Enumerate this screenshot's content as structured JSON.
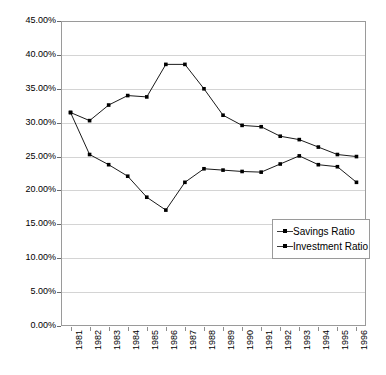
{
  "chart_data": {
    "type": "line",
    "title": "",
    "subtitle": "",
    "xlabel": "",
    "ylabel": "",
    "categories": [
      "1981",
      "1982",
      "1983",
      "1984",
      "1985",
      "1986",
      "1987",
      "1988",
      "1989",
      "1990",
      "1991",
      "1992",
      "1993",
      "1994",
      "1995",
      "1996"
    ],
    "ytick_labels": [
      "45.00%",
      "40.00%",
      "35.00%",
      "30.00%",
      "25.00%",
      "20.00%",
      "15.00%",
      "10.00%",
      "5.00%",
      "0.00%"
    ],
    "ytick_values": [
      45,
      40,
      35,
      30,
      25,
      20,
      15,
      10,
      5,
      0
    ],
    "ylim": [
      0,
      45
    ],
    "y_units": "percent",
    "grid": "horizontal",
    "legend_position": "inside-bottom-right",
    "series": [
      {
        "name": "Savings Ratio",
        "marker": "square",
        "color": "#000000",
        "values": [
          31.5,
          30.3,
          32.6,
          34.0,
          33.8,
          38.6,
          38.6,
          35.0,
          31.1,
          29.6,
          29.4,
          28.0,
          27.5,
          26.4,
          25.3,
          25.0
        ]
      },
      {
        "name": "Investment Ratio",
        "marker": "square",
        "color": "#000000",
        "values": [
          31.5,
          25.3,
          23.8,
          22.1,
          19.0,
          17.1,
          21.2,
          23.2,
          23.0,
          22.8,
          22.7,
          23.9,
          25.1,
          23.8,
          23.5,
          21.2
        ]
      }
    ]
  },
  "legend": {
    "entries": [
      {
        "label": "Savings Ratio"
      },
      {
        "label": "Investment Ratio"
      }
    ]
  }
}
